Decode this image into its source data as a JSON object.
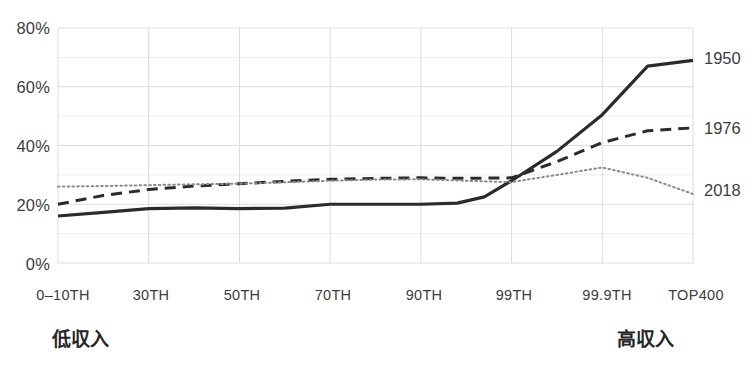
{
  "chart_data": {
    "type": "line",
    "title": "",
    "subtitle": "",
    "xlabel": "",
    "ylabel": "",
    "grid": true,
    "legend_position": "right-end-of-line",
    "ylim": [
      0,
      80
    ],
    "y_ticks": [
      0,
      20,
      40,
      60,
      80
    ],
    "y_tick_labels": [
      "0%",
      "20%",
      "40%",
      "60%",
      "80%"
    ],
    "categories": [
      "0-10TH",
      "30TH",
      "50TH",
      "70TH",
      "90TH",
      "99TH",
      "99.9TH",
      "TOP400"
    ],
    "x_tick_labels": [
      "0–10TH",
      "30TH",
      "50TH",
      "70TH",
      "90TH",
      "99TH",
      "99.9TH",
      "TOP400"
    ],
    "series": [
      {
        "name": "1950",
        "style": "solid",
        "color": "#2b2b2b",
        "values": [
          16,
          18.5,
          18.5,
          20,
          20,
          28,
          50.5,
          69
        ],
        "detail_points": [
          [
            0,
            16
          ],
          [
            0.5,
            17.2
          ],
          [
            1,
            18.5
          ],
          [
            1.5,
            18.8
          ],
          [
            2,
            18.5
          ],
          [
            2.5,
            18.7
          ],
          [
            3,
            20
          ],
          [
            3.5,
            20
          ],
          [
            4,
            20
          ],
          [
            4.4,
            20.4
          ],
          [
            4.7,
            22.5
          ],
          [
            5,
            28
          ],
          [
            5.5,
            38
          ],
          [
            6,
            50.5
          ],
          [
            6.5,
            67
          ],
          [
            7,
            69
          ]
        ]
      },
      {
        "name": "1976",
        "style": "dashed",
        "color": "#2b2b2b",
        "values": [
          20,
          25,
          27,
          28.5,
          29,
          29,
          41,
          46
        ],
        "detail_points": [
          [
            0,
            20
          ],
          [
            0.5,
            23
          ],
          [
            1,
            25
          ],
          [
            1.5,
            26.2
          ],
          [
            2,
            27
          ],
          [
            2.5,
            27.8
          ],
          [
            3,
            28.5
          ],
          [
            3.5,
            28.8
          ],
          [
            4,
            29
          ],
          [
            4.5,
            28.8
          ],
          [
            5,
            29
          ],
          [
            5.5,
            34.5
          ],
          [
            6,
            41
          ],
          [
            6.5,
            45
          ],
          [
            7,
            46
          ]
        ]
      },
      {
        "name": "2018",
        "style": "dotted",
        "color": "#8a8a8a",
        "values": [
          26,
          26.5,
          27,
          28,
          28.5,
          27.5,
          32.5,
          23.5
        ],
        "detail_points": [
          [
            0,
            26
          ],
          [
            0.5,
            26.2
          ],
          [
            1,
            26.5
          ],
          [
            1.5,
            26.8
          ],
          [
            2,
            27
          ],
          [
            2.5,
            27.5
          ],
          [
            3,
            28
          ],
          [
            3.5,
            28.4
          ],
          [
            4,
            28.5
          ],
          [
            4.5,
            28
          ],
          [
            5,
            27.5
          ],
          [
            5.5,
            30
          ],
          [
            6,
            32.5
          ],
          [
            6.5,
            29
          ],
          [
            7,
            23.5
          ]
        ]
      }
    ],
    "annotations": {
      "low_income": "低収入",
      "high_income": "高収入"
    }
  },
  "layout": {
    "plot_left": 58,
    "plot_right": 693,
    "plot_top": 28,
    "plot_bottom": 263
  }
}
